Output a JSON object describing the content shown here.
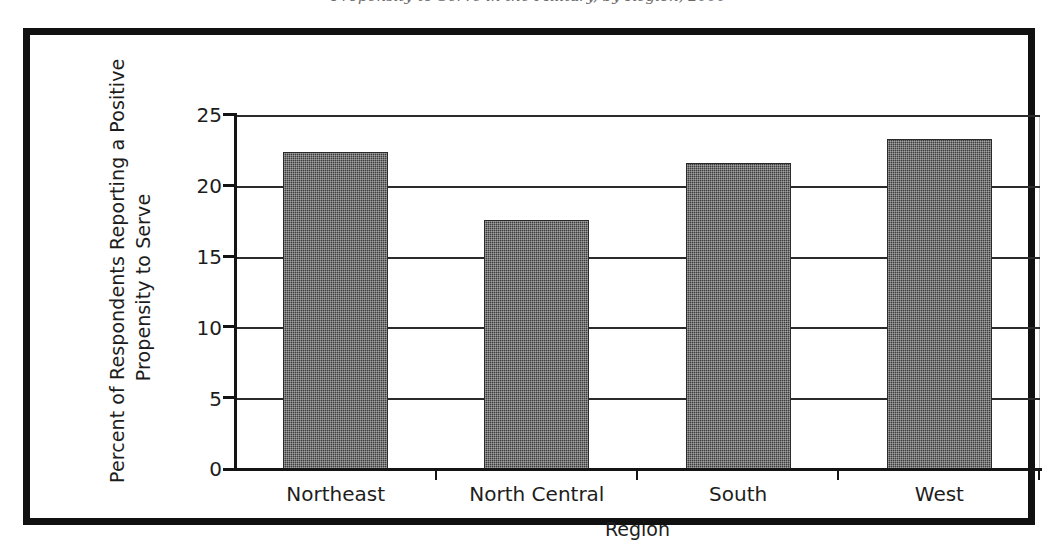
{
  "caption": {
    "text": "Propensity to Serve in the Military, by Region, 2000",
    "note": "clipped at top edge of image"
  },
  "chart_data": {
    "type": "bar",
    "title": "",
    "xlabel": "Region",
    "ylabel": "Percent of Respondents Reporting a Positive Propensity to Serve",
    "ylabel_lines": [
      "Percent of Respondents Reporting a Positive",
      "Propensity to Serve"
    ],
    "categories": [
      "Northeast",
      "North Central",
      "South",
      "West"
    ],
    "values": [
      22.4,
      17.6,
      21.6,
      23.3
    ],
    "ylim": [
      0,
      25
    ],
    "yticks": [
      0,
      5,
      10,
      15,
      20,
      25
    ],
    "ytick_labels": [
      "0",
      "5",
      "10",
      "15",
      "20",
      "25"
    ],
    "grid": true,
    "grid_axis": "y",
    "legend": false,
    "bar_color": "#3c3c3c",
    "bar_pattern": "fine-checkered-dither",
    "axis_color": "#141414",
    "gridline_color": "#2b2b2b",
    "frame_color": "#111111"
  }
}
